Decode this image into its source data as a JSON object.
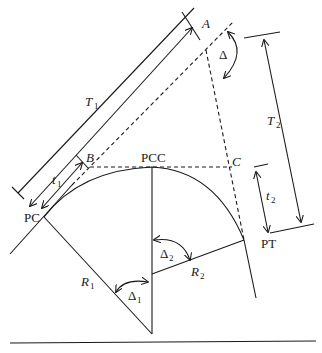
{
  "diagram": {
    "labels": {
      "A": "A",
      "B": "B",
      "C": "C",
      "PC": "PC",
      "PCC": "PCC",
      "PT": "PT",
      "T": "T",
      "t": "t",
      "R": "R",
      "delta": "Δ",
      "sub1": "1",
      "sub2": "2"
    },
    "caption": "",
    "colors": {
      "line": "#1a1a1a",
      "background": "#ffffff"
    }
  }
}
